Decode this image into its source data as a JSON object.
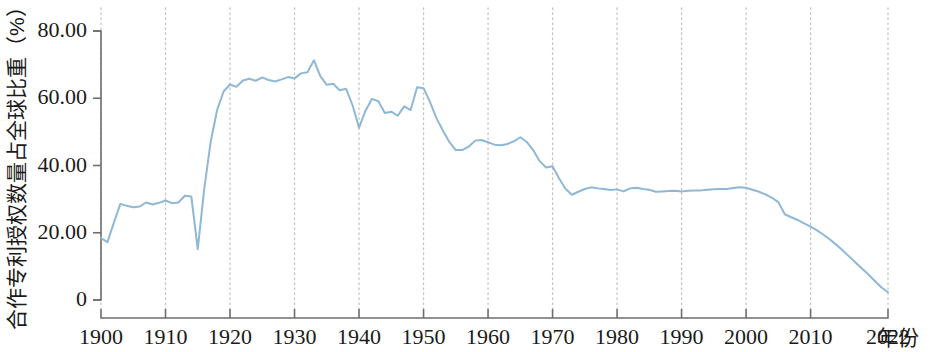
{
  "chart_data": {
    "type": "line",
    "title": "",
    "subtitle": "",
    "xlabel": "年份",
    "ylabel": "合作专利授权数量占全球比重（%）",
    "unit": "%",
    "grid": "vertical dotted gridlines at each decade tick",
    "legend": "none",
    "line_color": "#8fb8d6",
    "axis_color": "#6e6e6e",
    "grid_color": "#c9c4c0",
    "text_color": "#1a1a1a",
    "background_color": "#ffffff",
    "xlim": [
      1900,
      2022
    ],
    "ylim": [
      0,
      80
    ],
    "xticks": [
      1900,
      1910,
      1920,
      1930,
      1940,
      1950,
      1960,
      1970,
      1980,
      1990,
      2000,
      2010,
      2022
    ],
    "xtick_labels": [
      "1900",
      "1910",
      "1920",
      "1930",
      "1940",
      "1950",
      "1960",
      "1970",
      "1980",
      "1990",
      "2000",
      "2010",
      "2022"
    ],
    "yticks": [
      0,
      20,
      40,
      60,
      80
    ],
    "ytick_labels": [
      "0",
      "20.00",
      "40.00",
      "60.00",
      "80.00"
    ],
    "series": [
      {
        "name": "合作专利授权数量占全球比重",
        "x": [
          1900,
          1901,
          1902,
          1903,
          1904,
          1905,
          1906,
          1907,
          1908,
          1909,
          1910,
          1911,
          1912,
          1913,
          1914,
          1915,
          1916,
          1917,
          1918,
          1919,
          1920,
          1921,
          1922,
          1923,
          1924,
          1925,
          1926,
          1927,
          1928,
          1929,
          1930,
          1931,
          1932,
          1933,
          1934,
          1935,
          1936,
          1937,
          1938,
          1939,
          1940,
          1941,
          1942,
          1943,
          1944,
          1945,
          1946,
          1947,
          1948,
          1949,
          1950,
          1951,
          1952,
          1953,
          1954,
          1955,
          1956,
          1957,
          1958,
          1959,
          1960,
          1961,
          1962,
          1963,
          1964,
          1965,
          1966,
          1967,
          1968,
          1969,
          1970,
          1971,
          1972,
          1973,
          1974,
          1975,
          1976,
          1977,
          1978,
          1979,
          1980,
          1981,
          1982,
          1983,
          1984,
          1985,
          1986,
          1987,
          1988,
          1989,
          1990,
          1991,
          1992,
          1993,
          1994,
          1995,
          1996,
          1997,
          1998,
          1999,
          2000,
          2001,
          2002,
          2003,
          2004,
          2005,
          2006,
          2007,
          2008,
          2009,
          2010,
          2011,
          2012,
          2013,
          2014,
          2015,
          2016,
          2017,
          2018,
          2019,
          2020,
          2021,
          2022
        ],
        "values": [
          18.4,
          17.2,
          23.0,
          28.6,
          28.0,
          27.6,
          27.8,
          29.0,
          28.4,
          28.9,
          29.6,
          28.8,
          29.0,
          31.0,
          30.8,
          15.1,
          33.0,
          47.0,
          56.5,
          62.0,
          64.1,
          63.4,
          65.3,
          65.8,
          65.2,
          66.2,
          65.4,
          65.0,
          65.6,
          66.3,
          65.9,
          67.4,
          67.7,
          71.3,
          66.6,
          64.0,
          64.3,
          62.4,
          62.8,
          57.9,
          51.2,
          56.3,
          59.8,
          59.1,
          55.6,
          56.0,
          54.8,
          57.6,
          56.5,
          63.3,
          63.0,
          58.9,
          54.1,
          50.4,
          47.0,
          44.6,
          44.6,
          45.6,
          47.4,
          47.6,
          46.9,
          46.2,
          46.0,
          46.4,
          47.2,
          48.4,
          47.0,
          44.6,
          41.3,
          39.4,
          39.8,
          36.2,
          33.1,
          31.3,
          32.2,
          33.0,
          33.5,
          33.2,
          33.0,
          32.7,
          32.9,
          32.3,
          33.2,
          33.4,
          33.0,
          32.8,
          32.2,
          32.3,
          32.4,
          32.5,
          32.3,
          32.5,
          32.6,
          32.6,
          32.8,
          32.9,
          33.0,
          33.0,
          33.3,
          33.5,
          33.4,
          32.8,
          32.2,
          31.4,
          30.4,
          29.1,
          25.5,
          24.6,
          23.8,
          22.8,
          21.8,
          20.7,
          19.4,
          18.0,
          16.4,
          14.7,
          12.9,
          11.1,
          9.3,
          7.5,
          5.6,
          3.7,
          2.3
        ]
      }
    ]
  }
}
